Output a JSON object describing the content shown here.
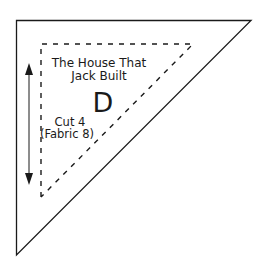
{
  "diagram": {
    "pattern_name_line1": "The House That",
    "pattern_name_line2": "Jack Built",
    "piece_letter": "D",
    "cut_line1": "Cut 4",
    "cut_line2": "(Fabric 8)",
    "colors": {
      "stroke": "#1a1a1a",
      "background": "#ffffff"
    },
    "shapes": {
      "outer_triangle": "right triangle, solid cut line",
      "inner_triangle": "right triangle, dashed seam line",
      "grain_arrow": "double-headed vertical grainline arrow"
    }
  }
}
